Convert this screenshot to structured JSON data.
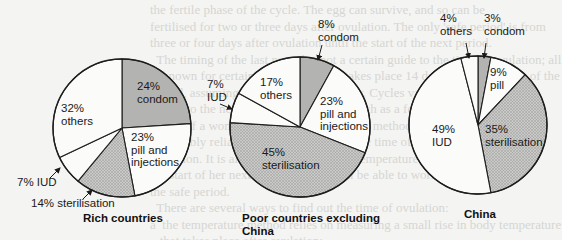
{
  "chart_data": [
    {
      "type": "pie",
      "title": "Rich countries",
      "start_angle_deg": 0,
      "direction": "clockwise",
      "slices": [
        {
          "label": "condom",
          "value": 24,
          "display": "24%",
          "fill": "condom"
        },
        {
          "label": "pill and injections",
          "value": 23,
          "display": "23%",
          "fill": "white"
        },
        {
          "label": "sterilisation",
          "value": 14,
          "display": "14%",
          "fill": "sterilisation"
        },
        {
          "label": "IUD",
          "value": 7,
          "display": "7%",
          "fill": "white"
        },
        {
          "label": "others",
          "value": 32,
          "display": "32%",
          "fill": "white"
        }
      ]
    },
    {
      "type": "pie",
      "title": "Poor countries excluding China",
      "start_angle_deg": 0,
      "direction": "clockwise",
      "slices": [
        {
          "label": "condom",
          "value": 8,
          "display": "8%",
          "fill": "condom"
        },
        {
          "label": "pill and injections",
          "value": 23,
          "display": "23%",
          "fill": "white"
        },
        {
          "label": "sterilisation",
          "value": 45,
          "display": "45%",
          "fill": "sterilisation"
        },
        {
          "label": "IUD",
          "value": 7,
          "display": "7%",
          "fill": "white"
        },
        {
          "label": "others",
          "value": 17,
          "display": "17%",
          "fill": "white"
        }
      ]
    },
    {
      "type": "pie",
      "title": "China",
      "start_angle_deg": 0,
      "direction": "clockwise",
      "slices": [
        {
          "label": "condom",
          "value": 3,
          "display": "3%",
          "fill": "condom"
        },
        {
          "label": "pill",
          "value": 9,
          "display": "9%",
          "fill": "white"
        },
        {
          "label": "sterilisation",
          "value": 35,
          "display": "35%",
          "fill": "sterilisation"
        },
        {
          "label": "IUD",
          "value": 49,
          "display": "49%",
          "fill": "white"
        },
        {
          "label": "others",
          "value": 4,
          "display": "4%",
          "fill": "white"
        }
      ]
    }
  ],
  "colors": {
    "condom": "#b3b3b1",
    "sterilisation": "#cacac8",
    "sterilisation_dot": "#8e8e8c",
    "white": "#fbfbfa",
    "stroke": "#1e1e1e"
  },
  "layout": [
    {
      "cx": 122,
      "cy": 128,
      "r": 69,
      "labels": [
        {
          "lines": [
            "24%",
            "condom"
          ],
          "x": 137,
          "y": 90
        },
        {
          "lines": [
            "23%",
            "pill and",
            "injections"
          ],
          "x": 131,
          "y": 141
        },
        {
          "lines": [
            "32%",
            "others"
          ],
          "x": 61,
          "y": 112
        },
        {
          "lines": [
            "7% IUD"
          ],
          "x": 17,
          "y": 186,
          "arrow": [
            [
              50,
              178
            ],
            [
              60,
              168
            ]
          ]
        },
        {
          "lines": [
            "14% sterilisation"
          ],
          "x": 31,
          "y": 207,
          "arrow": [
            [
              83,
              199
            ],
            [
              92,
              190
            ]
          ]
        }
      ],
      "title_lines": [
        "Rich countries"
      ],
      "title_x": 83,
      "title_y": 222
    },
    {
      "cx": 300,
      "cy": 127,
      "r": 70,
      "labels": [
        {
          "lines": [
            "8%",
            "condom"
          ],
          "x": 318,
          "y": 28,
          "arrow": [
            [
              322,
              45
            ],
            [
              318,
              60
            ]
          ]
        },
        {
          "lines": [
            "23%",
            "pill and",
            "injections"
          ],
          "x": 320,
          "y": 105
        },
        {
          "lines": [
            "17%",
            "others"
          ],
          "x": 260,
          "y": 86
        },
        {
          "lines": [
            "7%",
            "IUD"
          ],
          "x": 207,
          "y": 88,
          "arrow": [
            [
              220,
              104
            ],
            [
              232,
              109
            ]
          ]
        },
        {
          "lines": [
            "45%",
            "sterilisation"
          ],
          "x": 262,
          "y": 156
        }
      ],
      "title_lines": [
        "Poor countries excluding",
        "China"
      ],
      "title_x": 242,
      "title_y": 222
    },
    {
      "cx": 478,
      "cy": 125,
      "r": 69,
      "labels": [
        {
          "lines": [
            "3%",
            "condom"
          ],
          "x": 484,
          "y": 22,
          "arrow": [
            [
              486,
              43
            ],
            [
              484,
              58
            ]
          ]
        },
        {
          "lines": [
            "4%",
            "others"
          ],
          "x": 440,
          "y": 22,
          "arrow": [
            [
              466,
              43
            ],
            [
              469,
              58
            ]
          ]
        },
        {
          "lines": [
            "9%",
            " pill"
          ],
          "x": 490,
          "y": 76
        },
        {
          "lines": [
            "49%",
            "IUD"
          ],
          "x": 432,
          "y": 133
        },
        {
          "lines": [
            "35%",
            "sterilisation"
          ],
          "x": 485,
          "y": 133
        }
      ],
      "title_lines": [
        "China"
      ],
      "title_x": 464,
      "title_y": 218
    }
  ],
  "background_text": [
    "the fertile phase of the cycle. The egg can survive, and so can be",
    "fertilised for two or three days after ovulation. The only 'safe period' is from",
    "three or four days after ovulation until the start of the next period.",
    "  The timing of the last period is not a certain guide to the time of ovulation; all that",
    "is known for certain is that ovulation takes place 14 days before the start of the next",
    "period, assuming that the cycle is regular. Cycles vary from one",
    "month to the next, and can vary by as much as a few weeks (or even",
    "more). If a woman has a regular cycle, the method will be",
    "reasonably reliable and she can predict the time of her next",
    "ovulation. It is also possible to take the temperature a few days before",
    "the start of her next period and she will be able to work out",
    "the safe period.",
    "  There are several ways to find out the time of ovulation:",
    "a  the temperature method relies on measuring a small rise in body temperature",
    "   that takes place after ovulation;",
    "b  the billings or mucus method relies on detecting changes in the mucus of the"
  ]
}
